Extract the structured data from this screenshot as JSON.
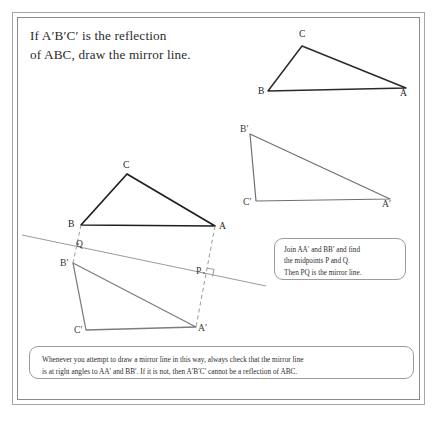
{
  "page": {
    "background": "#ffffff",
    "frame_color": "#a6a6a6"
  },
  "title": {
    "line1": "If A′B′C′ is the reflection",
    "line2": "of ABC, draw the mirror line."
  },
  "figures": {
    "top_triangle": {
      "name": "triangle-ABC-top",
      "labels": {
        "A": "A",
        "B": "B",
        "C": "C"
      },
      "vertices": {
        "A": [
          406,
          88
        ],
        "B": [
          268,
          91
        ],
        "C": [
          302,
          46
        ]
      },
      "stroke": "#2b2b2b"
    },
    "middle_triangle": {
      "name": "triangle-A-prime-B-prime-C-prime",
      "labels": {
        "A": "A′",
        "B": "B′",
        "C": "C′"
      },
      "vertices": {
        "A": [
          390,
          199
        ],
        "B": [
          250,
          134
        ],
        "C": [
          256,
          201
        ]
      },
      "stroke": "#6f6f6f"
    },
    "main_construction": {
      "name": "mirror-line-construction",
      "triangle_abc": {
        "labels": {
          "A": "A",
          "B": "B",
          "C": "C"
        },
        "vertices": {
          "A": [
            215,
            226
          ],
          "B": [
            81,
            225
          ],
          "C": [
            127,
            174
          ]
        },
        "stroke": "#1f1f1f"
      },
      "triangle_abc_prime": {
        "labels": {
          "A": "A′",
          "B": "B′",
          "C": "C′"
        },
        "vertices": {
          "A": [
            196,
            327
          ],
          "B": [
            73,
            263
          ],
          "C": [
            86,
            330
          ]
        },
        "stroke": "#7d7d7d"
      },
      "midpoints": {
        "P": {
          "label": "P",
          "pos": [
            204,
            274
          ]
        },
        "Q": {
          "label": "Q",
          "pos": [
            77,
            243
          ]
        }
      },
      "mirror_line": {
        "from": [
          22,
          235
        ],
        "to": [
          266,
          286
        ],
        "stroke": "#9a9a9a"
      },
      "connector_AA": {
        "from": [
          215,
          226
        ],
        "to": [
          196,
          327
        ],
        "dashed": true
      },
      "connector_BB": {
        "from": [
          81,
          225
        ],
        "to": [
          73,
          263
        ],
        "dashed": true
      },
      "right_angle_marker": true
    }
  },
  "callouts": {
    "join": {
      "line1": "Join AA′ and BB′ and find",
      "line2": "the midpoints P and Q.",
      "line3": "Then PQ is the mirror line."
    },
    "note": {
      "line1": "Whenever you attempt to draw a mirror line in this way, always check that the mirror line",
      "line2": "is at right angles to AA′ and BB′.  If it is not, then A′B′C′ cannot be a reflection of ABC."
    }
  }
}
